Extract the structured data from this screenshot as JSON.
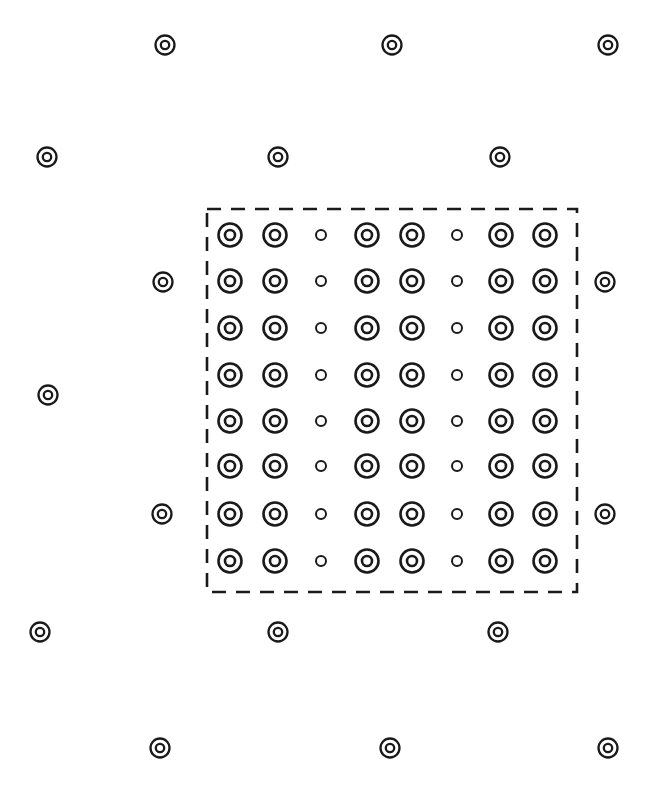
{
  "figure": {
    "type": "lattice-diagram",
    "width": 654,
    "height": 794,
    "background_color": "#ffffff",
    "stroke_color": "#1a1a1a",
    "title": "",
    "caption": ""
  },
  "unit_cell": {
    "name": "unit-cell-boundary",
    "shape": "rectangle",
    "x": 207,
    "y": 209,
    "width": 370,
    "height": 383,
    "line_style": "dashed",
    "dash_length": 14,
    "dash_gap": 10,
    "stroke_width": 2.6,
    "stroke_color": "#1a1a1a"
  },
  "inner_array": {
    "name": "inner-marker-grid",
    "rows": 8,
    "columns": 8,
    "column_centers": [
      230,
      275,
      321,
      367,
      412,
      457,
      501,
      545
    ],
    "row_centers": [
      235,
      281,
      328,
      375,
      421,
      466,
      514,
      561
    ],
    "column_spacing": 45,
    "row_spacing": 46.5,
    "column_types": [
      "large",
      "large",
      "small",
      "large",
      "large",
      "small",
      "large",
      "large"
    ],
    "marker_large": {
      "name": "concentric-ring-marker",
      "outer_radius": 11.5,
      "inner_radius": 5.0,
      "stroke_width": 2.6
    },
    "marker_small": {
      "name": "small-ring-marker",
      "radius": 5.0,
      "stroke_width": 2.0
    }
  },
  "outer_array": {
    "name": "outer-marker-lattice",
    "marker": {
      "name": "concentric-ring-marker",
      "outer_radius": 9.5,
      "inner_radius": 4.2,
      "stroke_width": 2.3
    },
    "positions": [
      {
        "x": 165,
        "y": 45
      },
      {
        "x": 392,
        "y": 45
      },
      {
        "x": 608,
        "y": 45
      },
      {
        "x": 47,
        "y": 157
      },
      {
        "x": 278,
        "y": 157
      },
      {
        "x": 500,
        "y": 157
      },
      {
        "x": 163,
        "y": 282
      },
      {
        "x": 605,
        "y": 282
      },
      {
        "x": 48,
        "y": 395
      },
      {
        "x": 162,
        "y": 514
      },
      {
        "x": 605,
        "y": 514
      },
      {
        "x": 40,
        "y": 632
      },
      {
        "x": 278,
        "y": 632
      },
      {
        "x": 498,
        "y": 632
      },
      {
        "x": 160,
        "y": 748
      },
      {
        "x": 390,
        "y": 748
      },
      {
        "x": 608,
        "y": 748
      }
    ]
  }
}
